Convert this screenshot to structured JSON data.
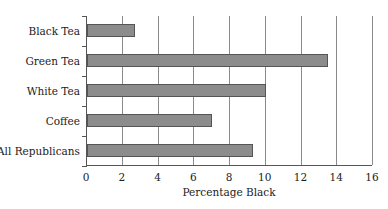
{
  "chart_data": {
    "type": "bar",
    "orientation": "horizontal",
    "title": "",
    "xlabel": "Percentage Black",
    "ylabel": "",
    "categories": [
      "Black Tea",
      "Green Tea",
      "White Tea",
      "Coffee",
      "All Republicans"
    ],
    "values": [
      2.7,
      13.5,
      10.0,
      7.0,
      9.3
    ],
    "xlim": [
      0,
      16
    ],
    "xticks": [
      "0",
      "2",
      "4",
      "6",
      "8",
      "10",
      "12",
      "14",
      "16"
    ],
    "grid": "vertical",
    "legend": null,
    "bar_color": "#8c8c8c"
  }
}
